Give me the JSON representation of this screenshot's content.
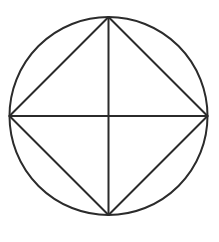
{
  "canvas": {
    "width": 219,
    "height": 242,
    "background_color": "#ffffff",
    "title": "Circle with inscribed square and diameters"
  },
  "style": {
    "stroke_color": "#2b2b2b",
    "stroke_width": 2,
    "fill": "none"
  },
  "geometry": {
    "center": {
      "x": 108.5,
      "y": 116
    },
    "radius": 99,
    "circle": {
      "name": "circumscribed-circle",
      "cx": 108.5,
      "cy": 116,
      "r": 99
    },
    "vertices": {
      "top": {
        "x": 108.5,
        "y": 17
      },
      "right": {
        "x": 207.5,
        "y": 116
      },
      "bottom": {
        "x": 108.5,
        "y": 215
      },
      "left": {
        "x": 9.5,
        "y": 116
      }
    },
    "inscribed_square": {
      "name": "inscribed-square-diamond",
      "rotation_deg": 45,
      "points": "108.5,17 207.5,116 108.5,215 9.5,116"
    },
    "diameters": [
      {
        "name": "vertical-diameter",
        "x1": 108.5,
        "y1": 17,
        "x2": 108.5,
        "y2": 215
      },
      {
        "name": "horizontal-diameter",
        "x1": 9.5,
        "y1": 116,
        "x2": 207.5,
        "y2": 116
      }
    ],
    "triangle_count": 4,
    "triangles": [
      {
        "name": "triangle-top-left",
        "points": "108.5,17 108.5,116 9.5,116"
      },
      {
        "name": "triangle-top-right",
        "points": "108.5,17 207.5,116 108.5,116"
      },
      {
        "name": "triangle-bottom-right",
        "points": "108.5,116 207.5,116 108.5,215"
      },
      {
        "name": "triangle-bottom-left",
        "points": "9.5,116 108.5,116 108.5,215"
      }
    ]
  }
}
